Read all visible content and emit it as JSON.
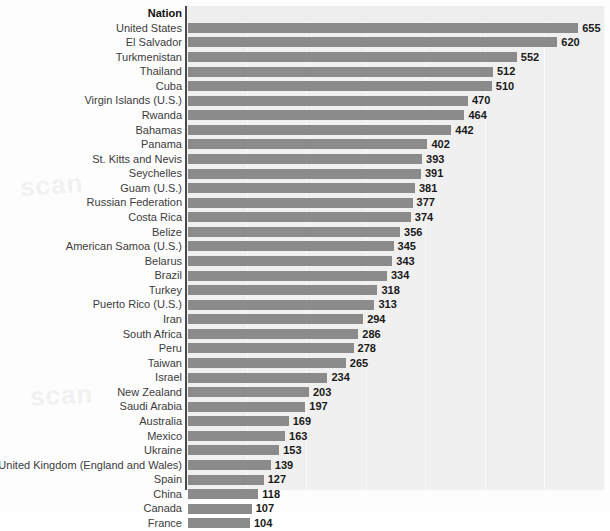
{
  "header": {
    "column_label": "Nation"
  },
  "footnote": {
    "text": "cut-off source line"
  },
  "style": {
    "bar_color": "#8b8b8b",
    "panel_color": "#f0f0f0",
    "axis_color": "#4a4a4a",
    "label_color": "#3c3c3c",
    "value_color": "#1a1a1a"
  },
  "chart_data": {
    "type": "bar",
    "orientation": "horizontal",
    "title": "",
    "subtitle": "",
    "xlabel": "",
    "ylabel": "Nation",
    "grid": true,
    "legend": null,
    "xlim": [
      0,
      700
    ],
    "value_labels_shown": true,
    "sorted": "descending",
    "categories": [
      "United States",
      "El Salvador",
      "Turkmenistan",
      "Thailand",
      "Cuba",
      "Virgin Islands (U.S.)",
      "Rwanda",
      "Bahamas",
      "Panama",
      "St. Kitts and Nevis",
      "Seychelles",
      "Guam (U.S.)",
      "Russian Federation",
      "Costa Rica",
      "Belize",
      "American Samoa (U.S.)",
      "Belarus",
      "Brazil",
      "Turkey",
      "Puerto Rico (U.S.)",
      "Iran",
      "South Africa",
      "Peru",
      "Taiwan",
      "Israel",
      "New Zealand",
      "Saudi Arabia",
      "Australia",
      "Mexico",
      "Ukraine",
      "United Kingdom (England and Wales)",
      "Spain",
      "China",
      "Canada",
      "France"
    ],
    "values": [
      655,
      620,
      552,
      512,
      510,
      470,
      464,
      442,
      402,
      393,
      391,
      381,
      377,
      374,
      356,
      345,
      343,
      334,
      318,
      313,
      294,
      286,
      278,
      265,
      234,
      203,
      197,
      169,
      163,
      153,
      139,
      127,
      118,
      107,
      104
    ]
  }
}
